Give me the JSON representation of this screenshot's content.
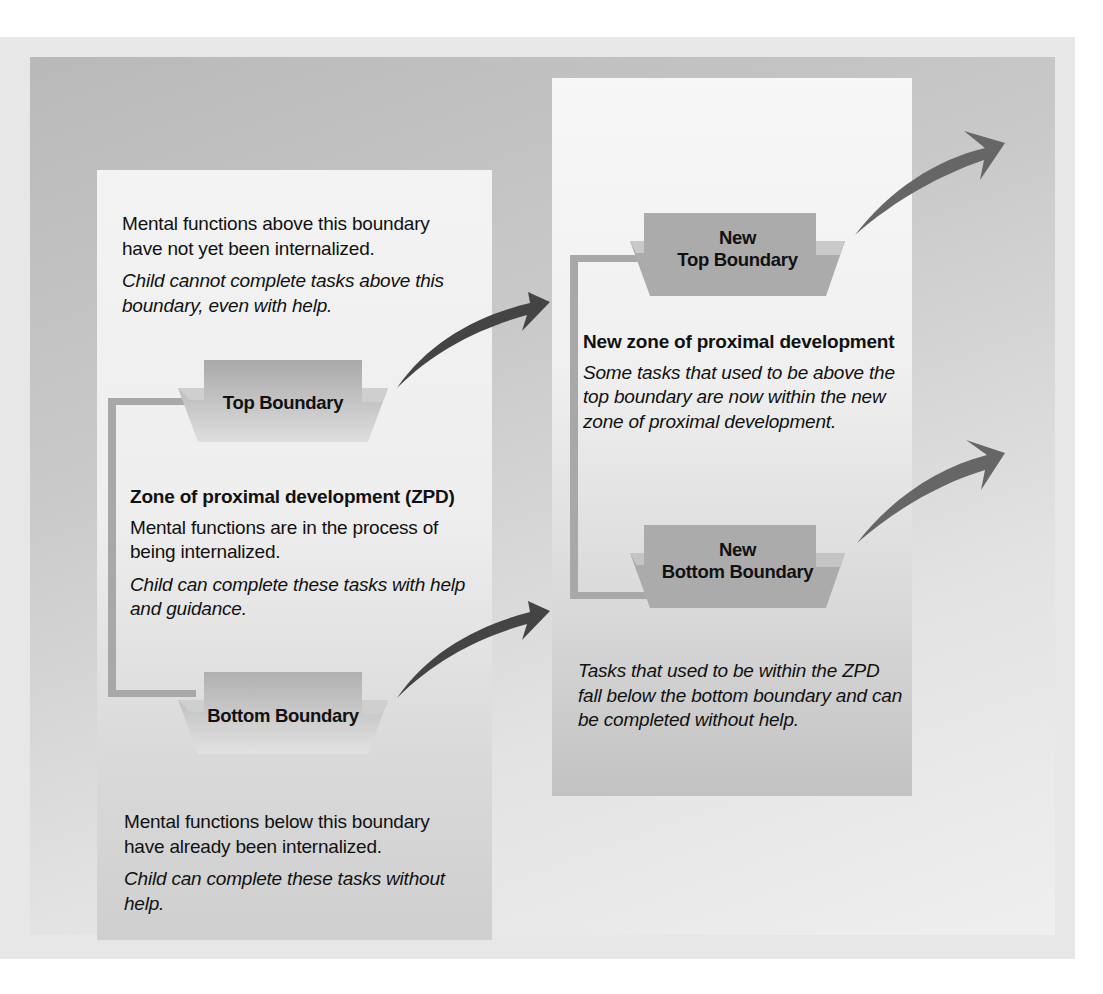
{
  "colors": {
    "frame": "#e7e7e7",
    "panel_dark": "#b9b9b9",
    "panel_light": "#efefef",
    "column_light": "#f3f3f3",
    "trapezoid": "#b3b3b3",
    "bracket": "#a8a8a8",
    "arrow": "#5e5e5e",
    "text": "#111111"
  },
  "left_column": {
    "above_text": "Mental functions above this boundary have not yet  been internalized.",
    "above_italic": "Child cannot complete tasks above this boundary, even with help.",
    "top_boundary_label": "Top Boundary",
    "zpd_heading": "Zone of proximal development (ZPD)",
    "zpd_text": "Mental functions are in the process of being internalized.",
    "zpd_italic": "Child can complete these tasks with help and guidance.",
    "bottom_boundary_label": "Bottom Boundary",
    "below_text": "Mental functions below this boundary have already been internalized.",
    "below_italic": "Child can complete these tasks without help."
  },
  "right_column": {
    "new_top_boundary_line1": "New",
    "new_top_boundary_line2": "Top Boundary",
    "new_zpd_heading": "New zone of proximal development",
    "new_zpd_italic": "Some tasks that used to be above the top boundary are now within the new zone of proximal development.",
    "new_bottom_boundary_line1": "New",
    "new_bottom_boundary_line2": "Bottom Boundary",
    "below_italic": "Tasks that used to be within the ZPD fall below the bottom boundary and can be completed without help."
  },
  "arrows": [
    {
      "name": "top-boundary-shift",
      "from": "Top Boundary",
      "to": "New Top Boundary"
    },
    {
      "name": "bottom-boundary-shift",
      "from": "Bottom Boundary",
      "to": "New Bottom Boundary"
    },
    {
      "name": "new-top-boundary-shift",
      "from": "New Top Boundary",
      "to": "beyond"
    },
    {
      "name": "new-bottom-boundary-shift",
      "from": "New Bottom Boundary",
      "to": "beyond"
    }
  ]
}
